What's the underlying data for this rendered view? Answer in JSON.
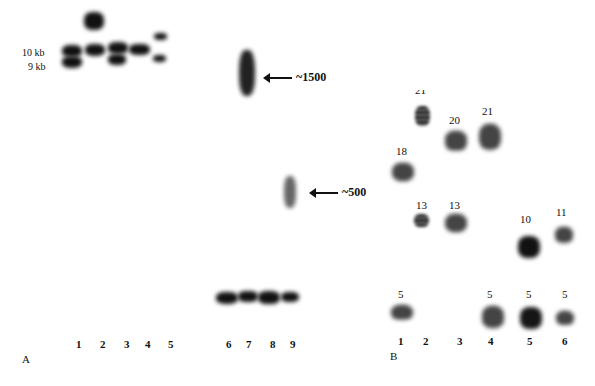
{
  "figure": {
    "panel_a": {
      "label": "A",
      "size_markers": [
        "10 kb",
        "9 kb"
      ],
      "lane_labels": [
        "1",
        "2",
        "3",
        "4",
        "5",
        "6",
        "7",
        "8",
        "9"
      ],
      "annotations": [
        {
          "text": "~1500",
          "lane": "7"
        },
        {
          "text": "~500",
          "lane": "9"
        }
      ]
    },
    "panel_b": {
      "label": "B",
      "lane_labels": [
        "1",
        "2",
        "3",
        "4",
        "5",
        "6"
      ],
      "band_labels": {
        "lane1": [
          "18",
          "5"
        ],
        "lane2": [
          "21",
          "13"
        ],
        "lane3": [
          "20",
          "13"
        ],
        "lane4": [
          "21",
          "5"
        ],
        "lane5": [
          "10",
          "5"
        ],
        "lane6": [
          "11",
          "5"
        ]
      }
    }
  }
}
